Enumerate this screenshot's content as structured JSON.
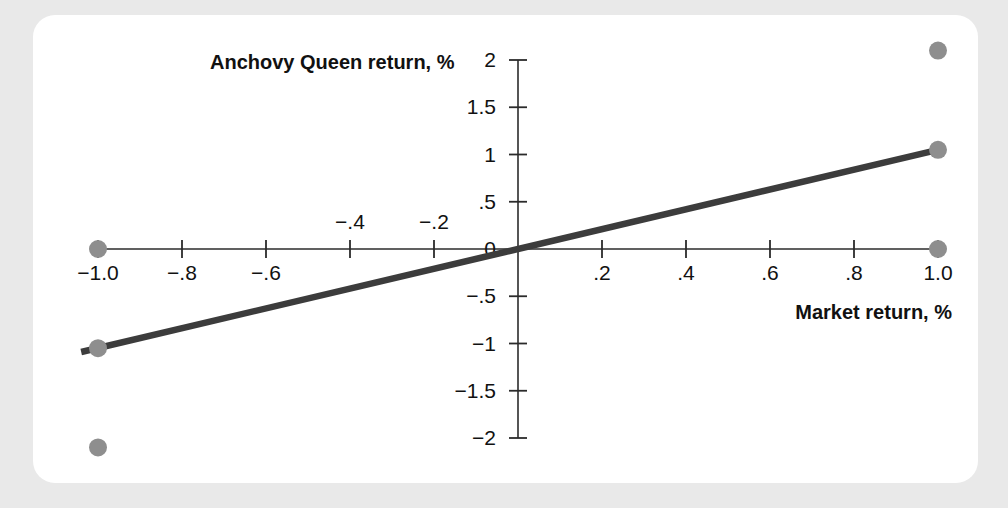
{
  "card": {
    "background": "#ffffff",
    "page_background": "#e9e9e9"
  },
  "chart_data": {
    "type": "scatter",
    "title": "",
    "xlabel": "Market return, %",
    "ylabel": "Anchovy Queen return, %",
    "xlim": [
      -1.0,
      1.0
    ],
    "ylim": [
      -2.0,
      2.0
    ],
    "grid": false,
    "legend": "none",
    "x_ticks": [
      {
        "value": -1.0,
        "label": "−1.0",
        "side": "below"
      },
      {
        "value": -0.8,
        "label": "−.8",
        "side": "below"
      },
      {
        "value": -0.6,
        "label": "−.6",
        "side": "below"
      },
      {
        "value": -0.4,
        "label": "−.4",
        "side": "above"
      },
      {
        "value": -0.2,
        "label": "−.2",
        "side": "above"
      },
      {
        "value": 0.2,
        "label": ".2",
        "side": "below"
      },
      {
        "value": 0.4,
        "label": ".4",
        "side": "below"
      },
      {
        "value": 0.6,
        "label": ".6",
        "side": "below"
      },
      {
        "value": 0.8,
        "label": ".8",
        "side": "below"
      },
      {
        "value": 1.0,
        "label": "1.0",
        "side": "below"
      }
    ],
    "y_ticks": [
      {
        "value": 2.0,
        "label": "2"
      },
      {
        "value": 1.5,
        "label": "1.5"
      },
      {
        "value": 1.0,
        "label": "1"
      },
      {
        "value": 0.5,
        "label": ".5"
      },
      {
        "value": 0.0,
        "label": "0"
      },
      {
        "value": -0.5,
        "label": "−.5"
      },
      {
        "value": -1.0,
        "label": "−1"
      },
      {
        "value": -1.5,
        "label": "−1.5"
      },
      {
        "value": -2.0,
        "label": "−2"
      }
    ],
    "points": [
      {
        "x": 1.0,
        "y": 2.1,
        "marker": "circle"
      },
      {
        "x": 1.0,
        "y": 1.05,
        "marker": "circle"
      },
      {
        "x": 1.0,
        "y": 0.0,
        "marker": "circle"
      },
      {
        "x": -1.0,
        "y": 0.0,
        "marker": "circle"
      },
      {
        "x": -1.0,
        "y": -1.05,
        "marker": "circle"
      },
      {
        "x": -1.0,
        "y": -2.1,
        "marker": "circle"
      }
    ],
    "fit_line": {
      "x1": -1.04,
      "y1": -1.09,
      "x2": 1.01,
      "y2": 1.06,
      "slope": 1.05,
      "intercept": 0.0,
      "color": "#3c3c3c"
    },
    "colors": {
      "marker": "#8e8e8e",
      "line": "#3c3c3c",
      "axis": "#2b2b2b",
      "text": "#111111"
    }
  }
}
